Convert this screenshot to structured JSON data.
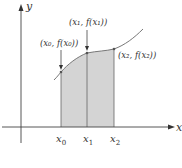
{
  "diagram": {
    "axes": {
      "x_label": "x",
      "y_label": "y"
    },
    "points": [
      {
        "tick_base": "x",
        "tick_sub": "0",
        "label": "(x₀, f(x₀))"
      },
      {
        "tick_base": "x",
        "tick_sub": "1",
        "label": "(x₁, f(x₁))"
      },
      {
        "tick_base": "x",
        "tick_sub": "2",
        "label": "(x₂, f(x₂))"
      }
    ],
    "colors": {
      "shade": "#d4d4d4",
      "axis": "#444444",
      "curve": "#777777"
    }
  }
}
